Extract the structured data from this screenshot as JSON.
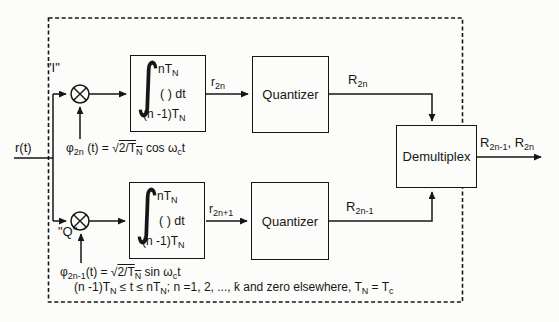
{
  "diagram": {
    "title_semantic": "QPSK receiver correlator demodulator block diagram",
    "input_label": "r(t)",
    "i_branch_label": "\"I\"",
    "q_branch_label": "\"Q\"",
    "multiplier_symbol": "mixer-multiply",
    "integrator": {
      "sign": "∫",
      "upper": "nT<sub>N</sub>",
      "operand": "( ) dt",
      "lower": "(n -1)T<sub>N</sub>"
    },
    "quantizer_label": "Quantizer",
    "demultiplex_label": "Demultiplex",
    "signals": {
      "i_integrator_out": "r<sub>2n</sub>",
      "q_integrator_out": "r<sub>2n+1</sub>",
      "i_quantizer_out": "R<sub>2n</sub>",
      "q_quantizer_out": "R<sub>2n-1</sub>",
      "output": "R<sub>2n-1</sub>, R<sub>2n</sub>"
    },
    "equations": {
      "i_carrier": "φ<sub>2n</sub> (t) = √<u>2/T<sub>N</sub></u> cos ω<sub>c</sub>t",
      "q_carrier": "φ<sub>2n-1</sub>(t) = √<u>2/T<sub>N</sub></u> sin ω<sub>c</sub>t",
      "condition": "(n -1)T<sub>N</sub> ≤ t ≤ nT<sub>N</sub>; n =1, 2, ..., k̇ and zero elsewhere, T<sub>N</sub> = T<sub>c</sub>"
    },
    "colors": {
      "line": "#161616",
      "background": "#fcfcfa"
    }
  }
}
